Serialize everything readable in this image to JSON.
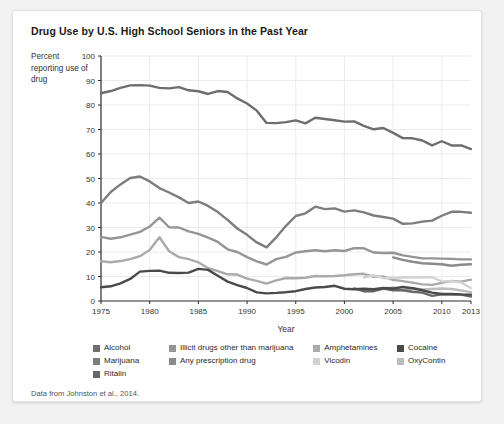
{
  "figure": {
    "title": "Drug Use by U.S. High School Seniors in the Past Year",
    "y_axis_caption": "Percent reporting use of drug",
    "source_note": "Data from Johnston et al., 2014."
  },
  "legend": {
    "rows": [
      [
        {
          "label": "Alcohol",
          "color": "#6e6e6e"
        },
        {
          "label": "Illicit drugs other than marijuana",
          "color": "#959595"
        },
        {
          "label": "Amphetamines",
          "color": "#aaaaaa"
        },
        {
          "label": "Cocaine",
          "color": "#4a4a4a"
        }
      ],
      [
        {
          "label": "Marijuana",
          "color": "#7d7d7d"
        },
        {
          "label": "Any prescription drug",
          "color": "#8a8a8a"
        },
        {
          "label": "Vicodin",
          "color": "#d2d2d2"
        },
        {
          "label": "OxyContin",
          "color": "#bdbdbd"
        }
      ],
      [
        {
          "label": "Ritalin",
          "color": "#666666"
        }
      ]
    ]
  },
  "chart_data": {
    "type": "line",
    "title": "Drug Use by U.S. High School Seniors in the Past Year",
    "xlabel": "Year",
    "ylabel": "Percent reporting use of drug",
    "xlim": [
      1975,
      2013
    ],
    "ylim": [
      0,
      100
    ],
    "xticks": [
      1975,
      1980,
      1985,
      1990,
      1995,
      2000,
      2005,
      2010,
      2013
    ],
    "yticks": [
      0,
      10,
      20,
      30,
      40,
      50,
      60,
      70,
      80,
      90,
      100
    ],
    "grid": true,
    "legend_position": "bottom",
    "series": [
      {
        "name": "Alcohol",
        "color": "#6e6e6e",
        "x": [
          1975,
          1976,
          1977,
          1978,
          1979,
          1980,
          1981,
          1982,
          1983,
          1984,
          1985,
          1986,
          1987,
          1988,
          1989,
          1990,
          1991,
          1992,
          1993,
          1994,
          1995,
          1996,
          1997,
          1998,
          1999,
          2000,
          2001,
          2002,
          2003,
          2004,
          2005,
          2006,
          2007,
          2008,
          2009,
          2010,
          2011,
          2012,
          2013
        ],
        "values": [
          84.8,
          85.7,
          87.0,
          88.0,
          88.1,
          87.9,
          87.0,
          86.8,
          87.3,
          86.0,
          85.6,
          84.5,
          85.7,
          85.3,
          82.7,
          80.6,
          77.7,
          72.7,
          72.6,
          73.0,
          73.7,
          72.5,
          74.8,
          74.3,
          73.8,
          73.2,
          73.3,
          71.5,
          70.1,
          70.6,
          68.6,
          66.5,
          66.4,
          65.5,
          63.5,
          65.2,
          63.5,
          63.5,
          62.0
        ]
      },
      {
        "name": "Marijuana",
        "color": "#7d7d7d",
        "x": [
          1975,
          1976,
          1977,
          1978,
          1979,
          1980,
          1981,
          1982,
          1983,
          1984,
          1985,
          1986,
          1987,
          1988,
          1989,
          1990,
          1991,
          1992,
          1993,
          1994,
          1995,
          1996,
          1997,
          1998,
          1999,
          2000,
          2001,
          2002,
          2003,
          2004,
          2005,
          2006,
          2007,
          2008,
          2009,
          2010,
          2011,
          2012,
          2013
        ],
        "values": [
          40.0,
          44.5,
          47.6,
          50.2,
          50.8,
          48.8,
          46.1,
          44.3,
          42.3,
          40.0,
          40.6,
          38.8,
          36.3,
          33.1,
          29.6,
          27.0,
          23.9,
          21.9,
          26.0,
          30.7,
          34.7,
          35.8,
          38.5,
          37.5,
          37.8,
          36.5,
          37.0,
          36.2,
          34.9,
          34.3,
          33.6,
          31.5,
          31.7,
          32.4,
          32.8,
          34.8,
          36.4,
          36.4,
          36.0
        ]
      },
      {
        "name": "Illicit drugs other than marijuana",
        "color": "#959595",
        "x": [
          1975,
          1976,
          1977,
          1978,
          1979,
          1980,
          1981,
          1982,
          1983,
          1984,
          1985,
          1986,
          1987,
          1988,
          1989,
          1990,
          1991,
          1992,
          1993,
          1994,
          1995,
          1996,
          1997,
          1998,
          1999,
          2000,
          2001,
          2002,
          2003,
          2004,
          2005,
          2006,
          2007,
          2008,
          2009,
          2010,
          2011,
          2012,
          2013
        ],
        "values": [
          26.2,
          25.4,
          26.0,
          27.1,
          28.2,
          30.4,
          34.0,
          30.1,
          30.0,
          28.4,
          27.4,
          25.9,
          24.1,
          21.1,
          20.0,
          17.9,
          16.2,
          14.9,
          17.1,
          18.0,
          19.8,
          20.3,
          20.7,
          20.3,
          20.7,
          20.4,
          21.6,
          21.5,
          19.8,
          19.6,
          19.7,
          18.6,
          18.0,
          17.4,
          17.4,
          17.3,
          17.2,
          17.0,
          17.0
        ]
      },
      {
        "name": "Any prescription drug",
        "color": "#8a8a8a",
        "x": [
          2005,
          2006,
          2007,
          2008,
          2009,
          2010,
          2011,
          2012,
          2013
        ],
        "values": [
          17.8,
          16.8,
          16.0,
          15.4,
          15.2,
          15.0,
          14.4,
          14.8,
          15.0
        ]
      },
      {
        "name": "Amphetamines",
        "color": "#aaaaaa",
        "x": [
          1975,
          1976,
          1977,
          1978,
          1979,
          1980,
          1981,
          1982,
          1983,
          1984,
          1985,
          1986,
          1987,
          1988,
          1989,
          1990,
          1991,
          1992,
          1993,
          1994,
          1995,
          1996,
          1997,
          1998,
          1999,
          2000,
          2001,
          2002,
          2003,
          2004,
          2005,
          2006,
          2007,
          2008,
          2009,
          2010,
          2011,
          2012,
          2013
        ],
        "values": [
          16.2,
          15.8,
          16.3,
          17.1,
          18.3,
          20.8,
          26.0,
          20.3,
          17.9,
          17.1,
          15.8,
          13.4,
          12.2,
          10.9,
          10.8,
          9.1,
          8.2,
          7.1,
          8.4,
          9.4,
          9.3,
          9.5,
          10.2,
          10.1,
          10.2,
          10.5,
          10.9,
          11.1,
          9.9,
          10.0,
          8.6,
          8.1,
          7.5,
          6.8,
          6.6,
          7.4,
          8.2,
          7.9,
          8.7
        ]
      },
      {
        "name": "Vicodin",
        "color": "#d2d2d2",
        "x": [
          2002,
          2003,
          2004,
          2005,
          2006,
          2007,
          2008,
          2009,
          2010,
          2011,
          2012,
          2013
        ],
        "values": [
          9.6,
          10.5,
          9.3,
          9.5,
          9.7,
          9.6,
          9.7,
          9.7,
          8.0,
          8.1,
          7.5,
          5.3
        ]
      },
      {
        "name": "OxyContin",
        "color": "#bdbdbd",
        "x": [
          2002,
          2003,
          2004,
          2005,
          2006,
          2007,
          2008,
          2009,
          2010,
          2011,
          2012,
          2013
        ],
        "values": [
          4.0,
          4.5,
          5.0,
          5.5,
          4.3,
          5.2,
          4.7,
          4.9,
          5.1,
          4.9,
          4.3,
          3.6
        ]
      },
      {
        "name": "Ritalin",
        "color": "#666666",
        "x": [
          2001,
          2002,
          2003,
          2004,
          2005,
          2006,
          2007,
          2008,
          2009,
          2010,
          2011,
          2012,
          2013
        ],
        "values": [
          5.1,
          4.0,
          4.0,
          5.1,
          4.4,
          4.4,
          3.8,
          3.4,
          2.1,
          2.7,
          2.6,
          2.6,
          1.8
        ]
      },
      {
        "name": "Cocaine",
        "color": "#4a4a4a",
        "x": [
          1975,
          1976,
          1977,
          1978,
          1979,
          1980,
          1981,
          1982,
          1983,
          1984,
          1985,
          1986,
          1987,
          1988,
          1989,
          1990,
          1991,
          1992,
          1993,
          1994,
          1995,
          1996,
          1997,
          1998,
          1999,
          2000,
          2001,
          2002,
          2003,
          2004,
          2005,
          2006,
          2007,
          2008,
          2009,
          2010,
          2011,
          2012,
          2013
        ],
        "values": [
          5.6,
          6.0,
          7.2,
          9.0,
          12.0,
          12.3,
          12.4,
          11.5,
          11.4,
          11.6,
          13.1,
          12.7,
          10.3,
          7.9,
          6.5,
          5.3,
          3.5,
          3.1,
          3.3,
          3.6,
          4.0,
          4.9,
          5.5,
          5.7,
          6.2,
          5.0,
          4.8,
          5.0,
          4.8,
          5.3,
          5.1,
          5.7,
          5.2,
          4.4,
          3.4,
          2.9,
          2.9,
          2.7,
          2.6
        ]
      }
    ]
  }
}
